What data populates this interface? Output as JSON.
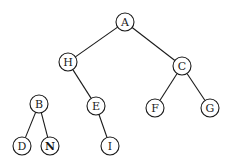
{
  "diagram": {
    "type": "tree",
    "colors": {
      "stroke": "#1a1a1a",
      "fill": "#ffffff",
      "background": "#ffffff"
    },
    "node_radius": 9,
    "nodes": [
      {
        "id": "A",
        "label": "A",
        "x": 125,
        "y": 22,
        "bold": false
      },
      {
        "id": "H",
        "label": "H",
        "x": 68,
        "y": 62,
        "bold": false
      },
      {
        "id": "C",
        "label": "C",
        "x": 182,
        "y": 66,
        "bold": false
      },
      {
        "id": "B",
        "label": "B",
        "x": 39,
        "y": 104,
        "bold": false
      },
      {
        "id": "E",
        "label": "E",
        "x": 96,
        "y": 106,
        "bold": false
      },
      {
        "id": "F",
        "label": "F",
        "x": 155,
        "y": 108,
        "bold": false
      },
      {
        "id": "G",
        "label": "G",
        "x": 210,
        "y": 108,
        "bold": false
      },
      {
        "id": "D",
        "label": "D",
        "x": 22,
        "y": 146,
        "bold": false
      },
      {
        "id": "N",
        "label": "N",
        "x": 50,
        "y": 146,
        "bold": true
      },
      {
        "id": "I",
        "label": "I",
        "x": 110,
        "y": 146,
        "bold": false
      }
    ],
    "edges": [
      {
        "from": "A",
        "to": "H"
      },
      {
        "from": "A",
        "to": "C"
      },
      {
        "from": "H",
        "to": "E"
      },
      {
        "from": "C",
        "to": "F"
      },
      {
        "from": "C",
        "to": "G"
      },
      {
        "from": "E",
        "to": "I"
      },
      {
        "from": "B",
        "to": "D"
      },
      {
        "from": "B",
        "to": "N"
      }
    ]
  }
}
